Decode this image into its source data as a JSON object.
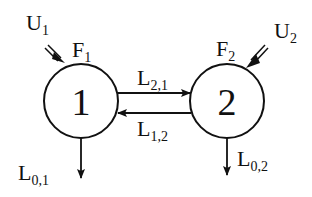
{
  "diagram": {
    "type": "two-compartment-model",
    "nodes": [
      {
        "id": "1",
        "label": "1",
        "flow_label": "F",
        "flow_sub": "1",
        "input_label": "U",
        "input_sub": "1",
        "output_label": "L",
        "output_sub": "0,1"
      },
      {
        "id": "2",
        "label": "2",
        "flow_label": "F",
        "flow_sub": "2",
        "input_label": "U",
        "input_sub": "2",
        "output_label": "L",
        "output_sub": "0,2"
      }
    ],
    "edges": [
      {
        "from": "1",
        "to": "2",
        "label": "L",
        "sub": "2,1"
      },
      {
        "from": "2",
        "to": "1",
        "label": "L",
        "sub": "1,2"
      }
    ],
    "colors": {
      "stroke": "#111111",
      "background": "#ffffff"
    }
  }
}
